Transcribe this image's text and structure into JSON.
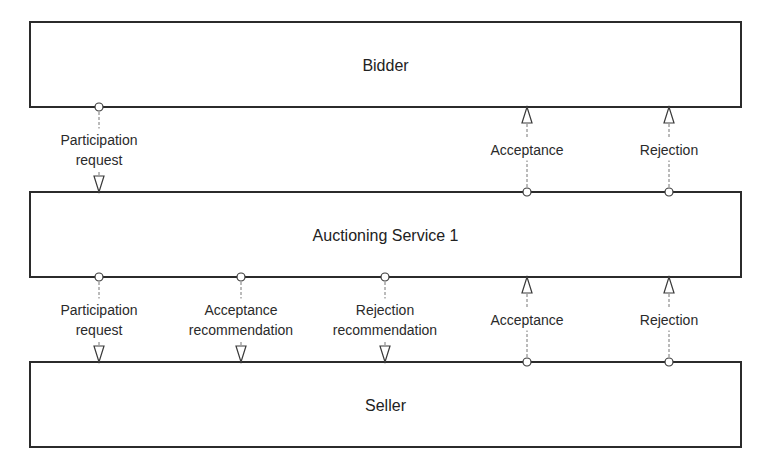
{
  "diagram": {
    "colors": {
      "background": "#ffffff",
      "box_stroke": "#2b2b2b",
      "text": "#222222",
      "connector": "#777777"
    },
    "boxes": [
      {
        "id": "bidder",
        "label": "Bidder",
        "x": 30,
        "y": 22,
        "w": 711,
        "h": 85
      },
      {
        "id": "auctioning-service-1",
        "label": "Auctioning Service 1",
        "x": 30,
        "y": 192,
        "w": 711,
        "h": 85
      },
      {
        "id": "seller",
        "label": "Seller",
        "x": 30,
        "y": 362,
        "w": 711,
        "h": 85
      }
    ],
    "connectors": [
      {
        "from": "bidder",
        "to": "auctioning-service-1",
        "x": 99,
        "direction": "down",
        "lines": [
          "Participation",
          "request"
        ]
      },
      {
        "from": "auctioning-service-1",
        "to": "bidder",
        "x": 527,
        "direction": "up",
        "lines": [
          "Acceptance"
        ]
      },
      {
        "from": "auctioning-service-1",
        "to": "bidder",
        "x": 669,
        "direction": "up",
        "lines": [
          "Rejection"
        ]
      },
      {
        "from": "auctioning-service-1",
        "to": "seller",
        "x": 99,
        "direction": "down",
        "lines": [
          "Participation",
          "request"
        ]
      },
      {
        "from": "auctioning-service-1",
        "to": "seller",
        "x": 241,
        "direction": "down",
        "lines": [
          "Acceptance",
          "recommendation"
        ]
      },
      {
        "from": "auctioning-service-1",
        "to": "seller",
        "x": 385,
        "direction": "down",
        "lines": [
          "Rejection",
          "recommendation"
        ]
      },
      {
        "from": "seller",
        "to": "auctioning-service-1",
        "x": 527,
        "direction": "up",
        "lines": [
          "Acceptance"
        ]
      },
      {
        "from": "seller",
        "to": "auctioning-service-1",
        "x": 669,
        "direction": "up",
        "lines": [
          "Rejection"
        ]
      }
    ]
  }
}
